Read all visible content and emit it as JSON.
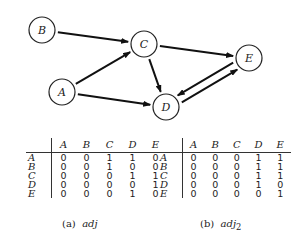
{
  "graph": {
    "nodes": [
      {
        "id": "A",
        "label": "A",
        "x": 62,
        "y": 92
      },
      {
        "id": "B",
        "label": "B",
        "x": 42,
        "y": 30
      },
      {
        "id": "C",
        "label": "C",
        "x": 144,
        "y": 44
      },
      {
        "id": "D",
        "label": "D",
        "x": 166,
        "y": 107
      },
      {
        "id": "E",
        "label": "E",
        "x": 249,
        "y": 58
      }
    ],
    "edges": [
      {
        "from": "B",
        "to": "C"
      },
      {
        "from": "A",
        "to": "C"
      },
      {
        "from": "A",
        "to": "D"
      },
      {
        "from": "C",
        "to": "D"
      },
      {
        "from": "C",
        "to": "E"
      },
      {
        "from": "D",
        "to": "E"
      },
      {
        "from": "E",
        "to": "D"
      }
    ],
    "node_radius": 13
  },
  "tables": [
    {
      "caption_prefix": "(a)",
      "caption_name": "adj",
      "caption_sub": "",
      "columns": [
        "A",
        "B",
        "C",
        "D",
        "E"
      ],
      "rows": [
        {
          "label": "A",
          "values": [
            "0",
            "0",
            "1",
            "1",
            "0"
          ]
        },
        {
          "label": "B",
          "values": [
            "0",
            "0",
            "1",
            "0",
            "0"
          ]
        },
        {
          "label": "C",
          "values": [
            "0",
            "0",
            "0",
            "1",
            "1"
          ]
        },
        {
          "label": "D",
          "values": [
            "0",
            "0",
            "0",
            "0",
            "1"
          ]
        },
        {
          "label": "E",
          "values": [
            "0",
            "0",
            "0",
            "1",
            "0"
          ]
        }
      ]
    },
    {
      "caption_prefix": "(b)",
      "caption_name": "adj",
      "caption_sub": "2",
      "columns": [
        "A",
        "B",
        "C",
        "D",
        "E"
      ],
      "rows": [
        {
          "label": "A",
          "values": [
            "0",
            "0",
            "0",
            "1",
            "1"
          ]
        },
        {
          "label": "B",
          "values": [
            "0",
            "0",
            "0",
            "1",
            "1"
          ]
        },
        {
          "label": "C",
          "values": [
            "0",
            "0",
            "0",
            "1",
            "1"
          ]
        },
        {
          "label": "D",
          "values": [
            "0",
            "0",
            "0",
            "1",
            "0"
          ]
        },
        {
          "label": "E",
          "values": [
            "0",
            "0",
            "0",
            "0",
            "1"
          ]
        }
      ]
    }
  ]
}
